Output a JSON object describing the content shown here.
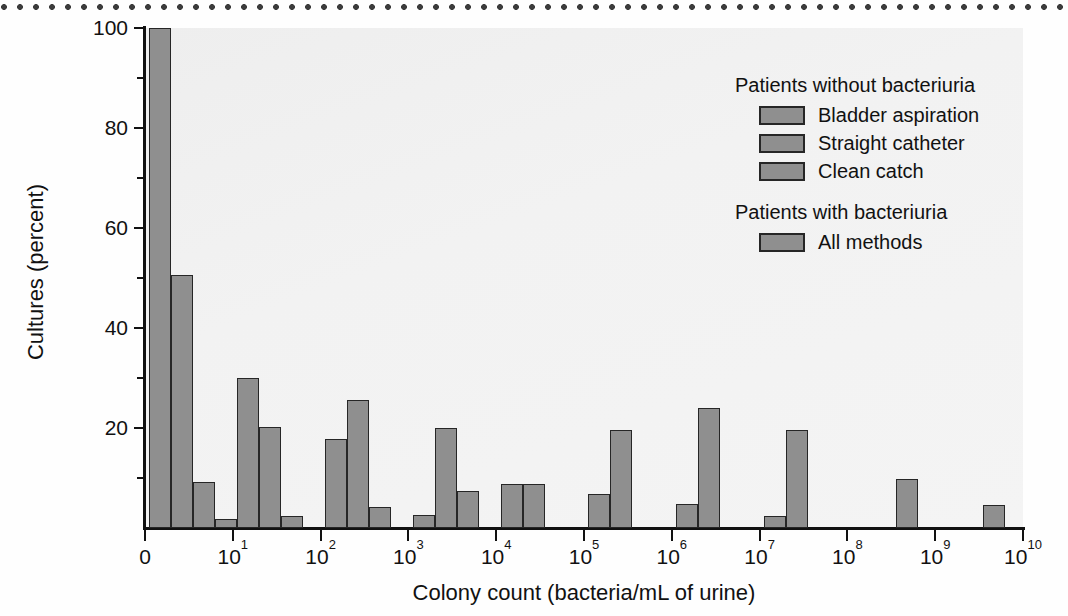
{
  "figure": {
    "y_axis_title": "Cultures (percent)",
    "x_axis_title": "Colony count (bacteria/mL of urine)"
  },
  "legend": {
    "group1_title": "Patients without bacteriuria",
    "group2_title": "Patients with bacteriuria",
    "entries": [
      {
        "label": "Bladder aspiration",
        "group": 1
      },
      {
        "label": "Straight catheter",
        "group": 1
      },
      {
        "label": "Clean catch",
        "group": 1
      },
      {
        "label": "All methods",
        "group": 2
      }
    ],
    "swatch_color": "#8f8f8f"
  },
  "chart_data": {
    "type": "bar",
    "title": "",
    "subtitle": "",
    "xlabel": "Colony count (bacteria/mL of urine)",
    "ylabel": "Cultures (percent)",
    "x_scale": "log",
    "x_tick_labels": [
      "0",
      "10^1",
      "10^2",
      "10^3",
      "10^4",
      "10^5",
      "10^6",
      "10^7",
      "10^8",
      "10^9",
      "10^10"
    ],
    "x_tick_values": [
      0,
      1,
      2,
      3,
      4,
      5,
      6,
      7,
      8,
      9,
      10
    ],
    "xlim_decades": [
      0,
      10
    ],
    "ylim": [
      0,
      100
    ],
    "y_ticks_major": [
      20,
      40,
      60,
      80,
      100
    ],
    "y_ticks_minor": [
      10,
      30,
      50,
      70,
      90
    ],
    "grid": false,
    "legend_position": "top-right",
    "bar_color": "#8f8f8f",
    "bar_edge_color": "#262626",
    "series": [
      {
        "name": "Bladder aspiration",
        "group": "Patients without bacteriuria",
        "points": [
          {
            "decade": 0.05,
            "value": 100.0
          },
          {
            "decade": 1.05,
            "value": 30.0
          },
          {
            "decade": 2.05,
            "value": 17.8
          },
          {
            "decade": 3.05,
            "value": 2.6
          },
          {
            "decade": 4.05,
            "value": 8.8
          },
          {
            "decade": 5.05,
            "value": 6.8
          },
          {
            "decade": 6.05,
            "value": 4.8
          },
          {
            "decade": 7.05,
            "value": 2.4
          }
        ]
      },
      {
        "name": "Straight catheter",
        "group": "Patients without bacteriuria",
        "points": [
          {
            "decade": 0.3,
            "value": 50.6
          },
          {
            "decade": 1.3,
            "value": 20.3
          },
          {
            "decade": 2.3,
            "value": 25.6
          },
          {
            "decade": 3.3,
            "value": 20.1
          },
          {
            "decade": 4.3,
            "value": 8.8
          },
          {
            "decade": 5.3,
            "value": 19.6
          },
          {
            "decade": 6.3,
            "value": 24.1
          },
          {
            "decade": 7.3,
            "value": 19.6
          }
        ]
      },
      {
        "name": "Clean catch",
        "group": "Patients without bacteriuria",
        "points": [
          {
            "decade": 0.55,
            "value": 9.3
          },
          {
            "decade": 1.55,
            "value": 2.5
          },
          {
            "decade": 2.55,
            "value": 4.2
          },
          {
            "decade": 3.55,
            "value": 7.4
          }
        ]
      },
      {
        "name": "All methods",
        "group": "Patients with bacteriuria",
        "points": [
          {
            "decade": 0.8,
            "value": 1.9
          },
          {
            "decade": 8.55,
            "value": 9.8
          },
          {
            "decade": 9.55,
            "value": 4.6
          }
        ]
      }
    ]
  }
}
